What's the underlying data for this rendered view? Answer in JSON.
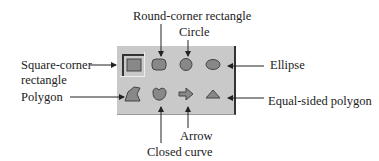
{
  "diagram": {
    "palette": {
      "background": "#c9c9c9",
      "shape_fill": "#888888",
      "tools": [
        {
          "id": "square-corner-rectangle",
          "row": 0,
          "col": 0,
          "selected": true
        },
        {
          "id": "round-corner-rectangle",
          "row": 0,
          "col": 1,
          "selected": false
        },
        {
          "id": "circle",
          "row": 0,
          "col": 2,
          "selected": false
        },
        {
          "id": "ellipse",
          "row": 0,
          "col": 3,
          "selected": false
        },
        {
          "id": "polygon",
          "row": 1,
          "col": 0,
          "selected": false
        },
        {
          "id": "closed-curve",
          "row": 1,
          "col": 1,
          "selected": false
        },
        {
          "id": "arrow",
          "row": 1,
          "col": 2,
          "selected": false
        },
        {
          "id": "equal-sided-polygon",
          "row": 1,
          "col": 3,
          "selected": false
        }
      ]
    },
    "labels": {
      "round_corner_rectangle": "Round-corner rectangle",
      "circle": "Circle",
      "square_corner_rectangle_line1": "Square-corner",
      "square_corner_rectangle_line2": "rectangle",
      "ellipse": "Ellipse",
      "polygon": "Polygon",
      "equal_sided_polygon": "Equal-sided polygon",
      "arrow": "Arrow",
      "closed_curve": "Closed curve"
    }
  }
}
